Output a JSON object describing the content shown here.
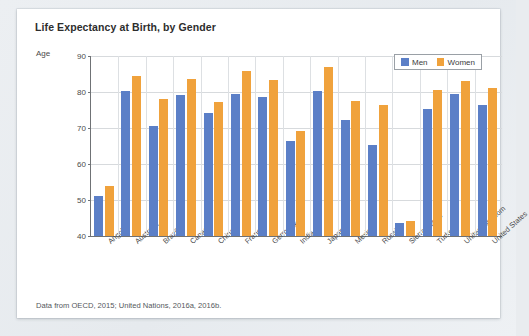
{
  "card": {
    "title": "Life Expectancy at Birth, by Gender",
    "source_note": "Data from OECD, 2015; United Nations, 2016a, 2016b."
  },
  "legend": {
    "men_label": "Men",
    "women_label": "Women",
    "men_color": "#5b7fc7",
    "women_color": "#f0a23c"
  },
  "chart_data": {
    "type": "bar",
    "title": "Life Expectancy at Birth, by Gender",
    "xlabel": "",
    "ylabel": "Age",
    "ylim": [
      40,
      90
    ],
    "yticks": [
      40,
      50,
      60,
      70,
      80,
      90
    ],
    "grid": true,
    "legend_position": "top-right",
    "categories": [
      "Angola",
      "Australia",
      "Brazil",
      "Canada",
      "China",
      "France",
      "Germany",
      "India",
      "Japan",
      "Mexico",
      "Russia",
      "Sierra Leone",
      "Turkey",
      "United Kingdom",
      "United States"
    ],
    "series": [
      {
        "name": "Men",
        "color": "#5b7fc7",
        "values": [
          51,
          80.2,
          70.6,
          79.3,
          74.2,
          79.4,
          78.6,
          66.5,
          80.4,
          72.1,
          65.2,
          43.6,
          75.3,
          79.4,
          76.4
        ]
      },
      {
        "name": "Women",
        "color": "#f0a23c",
        "values": [
          53.9,
          84.4,
          78.1,
          83.5,
          77.1,
          85.9,
          83.4,
          69.3,
          86.9,
          77.4,
          76.3,
          44.1,
          80.6,
          83.1,
          81.2
        ]
      }
    ]
  }
}
